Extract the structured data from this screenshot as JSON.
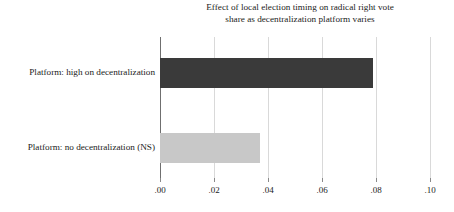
{
  "chart_data": {
    "type": "bar",
    "orientation": "horizontal",
    "title": "Effect of local election timing on radical right vote share as decentralization platform varies",
    "title_lines": [
      "Effect of local election timing on radical right vote",
      "share as decentralization platform varies"
    ],
    "categories": [
      "Platform: high on decentralization",
      "Platform: no decentralization (NS)"
    ],
    "values": [
      0.079,
      0.037
    ],
    "bar_colors": [
      "#3a3a3a",
      "#c8c8c8"
    ],
    "xlabel": "",
    "ylabel": "",
    "xlim": [
      0.0,
      0.1
    ],
    "xticks": [
      0.0,
      0.02,
      0.04,
      0.06,
      0.08,
      0.1
    ],
    "xtick_labels": [
      ".00",
      ".02",
      ".04",
      ".06",
      ".08",
      ".10"
    ],
    "grid": true,
    "grid_axis": "x",
    "legend": false,
    "background": "#ffffff",
    "axis_color": "#6f6f6f",
    "grid_color": "#d9d9d9",
    "text_color": "#1b1b1b"
  }
}
